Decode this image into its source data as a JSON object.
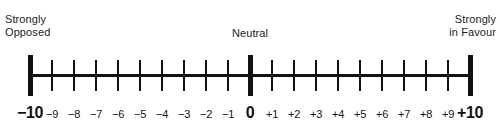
{
  "widget": {
    "name": "Opposition–Favour rating scale",
    "type": "bipolar-likert-scale"
  },
  "anchors": {
    "left": "Strongly\nOpposed",
    "middle": "Neutral",
    "right": "Strongly\nin Favour"
  },
  "chart_data": {
    "type": "scale",
    "title": "",
    "xlabel": "",
    "ylabel": "",
    "xlim": [
      -10,
      10
    ],
    "step": 1,
    "grid": false,
    "legend": null,
    "tick_labels": [
      "−10",
      "−9",
      "−8",
      "−7",
      "−6",
      "−5",
      "−4",
      "−3",
      "−2",
      "−1",
      "0",
      "+1",
      "+2",
      "+3",
      "+4",
      "+5",
      "+6",
      "+7",
      "+8",
      "+9",
      "+10"
    ],
    "tick_values": [
      -10,
      -9,
      -8,
      -7,
      -6,
      -5,
      -4,
      -3,
      -2,
      -1,
      0,
      1,
      2,
      3,
      4,
      5,
      6,
      7,
      8,
      9,
      10
    ],
    "major_ticks": [
      -10,
      0,
      10
    ],
    "anchor_labels": [
      {
        "value": -10,
        "text": "Strongly Opposed"
      },
      {
        "value": 0,
        "text": "Neutral"
      },
      {
        "value": 10,
        "text": "Strongly in Favour"
      }
    ],
    "colors": {
      "line": "#111111",
      "tick": "#111111",
      "text": "#1c1c1c",
      "background": "#ffffff"
    }
  }
}
